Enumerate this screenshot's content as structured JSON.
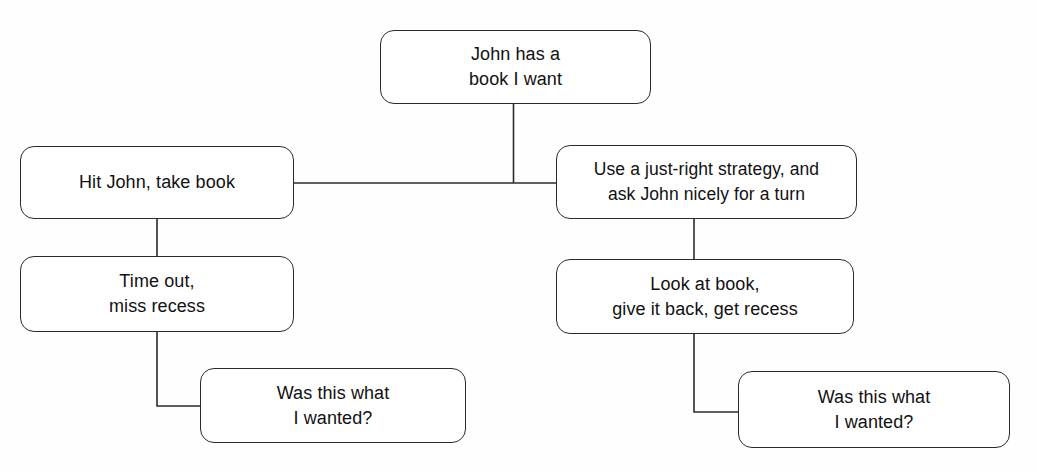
{
  "diagram": {
    "line_color": "#2b2b2b",
    "background_color": "#fefefe",
    "text_color": "#111111",
    "nodes": {
      "root": {
        "text": "John has a\nbook I want"
      },
      "aggressive": {
        "text": "Hit John, take book"
      },
      "strategy": {
        "text": "Use a just-right strategy, and\nask John nicely for a turn"
      },
      "timeout": {
        "text": "Time out,\nmiss recess"
      },
      "recess": {
        "text": "Look at book,\ngive it back, get recess"
      },
      "reflect_left": {
        "text": "Was this what\nI wanted?"
      },
      "reflect_right": {
        "text": "Was this what\nI wanted?"
      }
    },
    "connectors": [
      {
        "name": "root-to-branch",
        "path": "M 513.5 104 L 513.5 183"
      },
      {
        "name": "branch-bar",
        "path": "M 294 183 L 556 183"
      },
      {
        "name": "aggressive-to-timeout",
        "path": "M 157 219 L 157 256"
      },
      {
        "name": "strategy-to-recess",
        "path": "M 694 219 L 694 259"
      },
      {
        "name": "timeout-to-reflect-left",
        "path": "M 157 332 L 157 406 L 200 406"
      },
      {
        "name": "recess-to-reflect-right",
        "path": "M 694 334 L 694 412 L 738 412"
      }
    ]
  }
}
